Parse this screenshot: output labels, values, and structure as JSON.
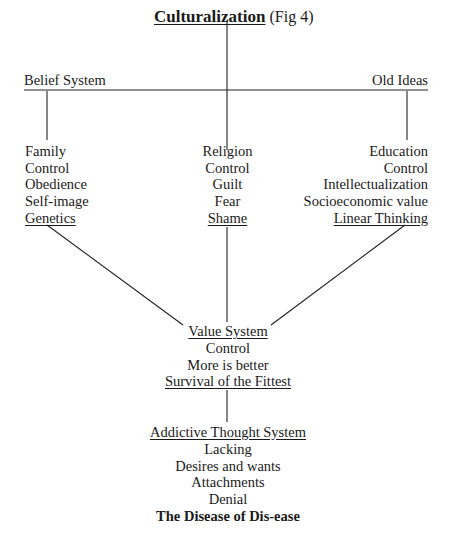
{
  "title": {
    "main": "Culturalization",
    "suffix": " (Fig 4)"
  },
  "header_row": {
    "left": "Belief System",
    "right": "Old Ideas"
  },
  "columns": [
    {
      "name": "family",
      "items": [
        "Family",
        "Control",
        "Obedience",
        "Self-image",
        "Genetics"
      ],
      "underlined_last": true
    },
    {
      "name": "religion",
      "items": [
        "Religion",
        "Control",
        "Guilt",
        "Fear",
        "Shame"
      ],
      "underlined_last": true
    },
    {
      "name": "education",
      "items": [
        "Education",
        "Control",
        "Intellectualization",
        "Socioeconomic value",
        "Linear Thinking"
      ],
      "underlined_last": true
    }
  ],
  "value_system": {
    "heading": "Value System",
    "items": [
      "Control",
      "More is better"
    ],
    "footer": "Survival of the Fittest"
  },
  "addictive_thought_system": {
    "heading": "Addictive Thought System",
    "items": [
      "Lacking",
      "Desires and wants",
      "Attachments",
      "Denial"
    ],
    "conclusion": "The Disease of Dis-ease"
  }
}
